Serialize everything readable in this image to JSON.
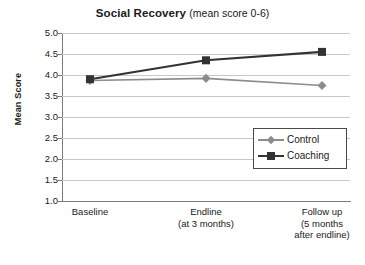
{
  "chart_data": {
    "type": "line",
    "title": "Social Recovery",
    "title_main": "Social Recovery",
    "title_sub": "(mean score 0-6)",
    "xlabel": "",
    "ylabel": "Mean Score",
    "ylim": [
      1.0,
      5.0
    ],
    "ytick_step": 0.5,
    "yticks": [
      "5.0",
      "4.5",
      "4.0",
      "3.5",
      "3.0",
      "2.5",
      "2.0",
      "1.5",
      "1.0"
    ],
    "ytick_values": [
      5.0,
      4.5,
      4.0,
      3.5,
      3.0,
      2.5,
      2.0,
      1.5,
      1.0
    ],
    "grid": true,
    "grid_axis": "y",
    "legend_position": "center-right",
    "categories": [
      "Baseline",
      "Endline",
      "Follow up"
    ],
    "category_labels": [
      [
        "Baseline"
      ],
      [
        "Endline",
        "(at 3 months)"
      ],
      [
        "Follow up",
        "(5 months",
        "after endline)"
      ]
    ],
    "series": [
      {
        "name": "Control",
        "values": [
          3.87,
          3.92,
          3.75
        ],
        "color": "#8c8c8c",
        "marker": "diamond"
      },
      {
        "name": "Coaching",
        "values": [
          3.9,
          4.35,
          4.55
        ],
        "color": "#333333",
        "marker": "square"
      }
    ]
  },
  "legend": {
    "items": [
      {
        "label": "Control",
        "color": "#8c8c8c",
        "marker": "diamond"
      },
      {
        "label": "Coaching",
        "color": "#333333",
        "marker": "square"
      }
    ]
  }
}
